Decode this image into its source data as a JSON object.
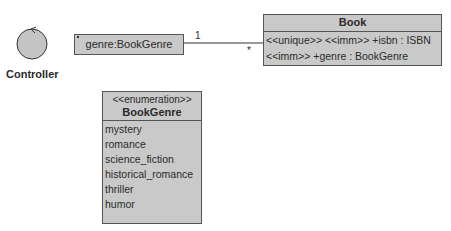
{
  "controller": {
    "label": "Controller",
    "icon": "controller-icon"
  },
  "genre_object": {
    "label": "genre:BookGenre"
  },
  "association": {
    "source_multiplicity": "1",
    "target_multiplicity": "*"
  },
  "book_class": {
    "name": "Book",
    "attributes": [
      "<<unique>> <<imm>> +isbn : ISBN",
      "<<imm>> +genre : BookGenre"
    ]
  },
  "enumeration": {
    "stereotype": "<<enumeration>>",
    "name": "BookGenre",
    "literals": [
      "mystery",
      "romance",
      "science_fiction",
      "historical_romance",
      "thriller",
      "humor"
    ]
  },
  "colors": {
    "fill": "#c9c9c9",
    "border": "#555555",
    "controller_fill": "#c4c4c4"
  }
}
